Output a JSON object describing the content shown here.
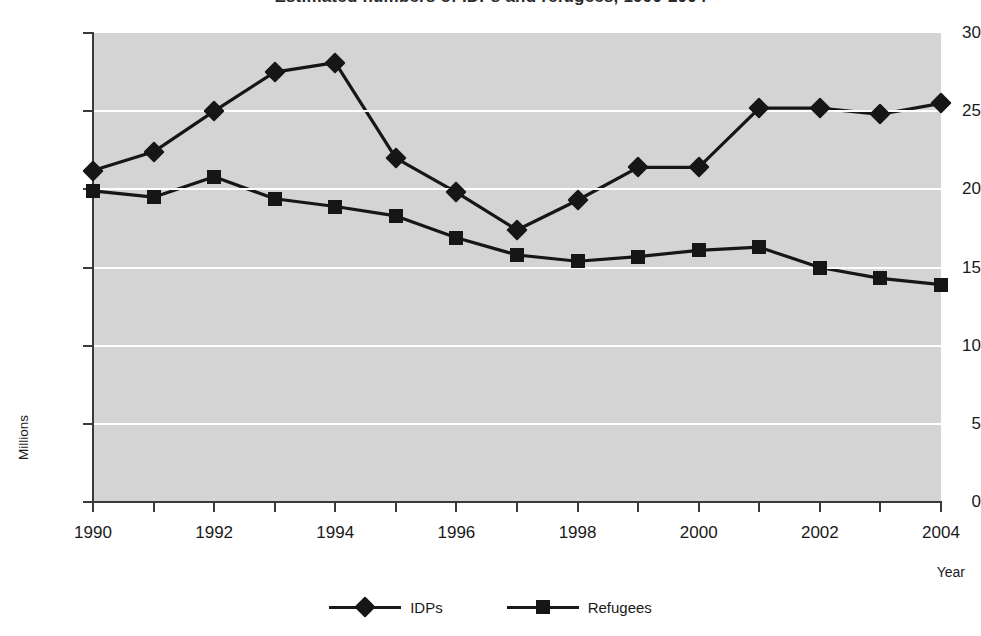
{
  "chart_data": {
    "type": "line",
    "title": "Estimated numbers of IDPs and refugees, 1990-2004",
    "xlabel": "Year",
    "ylabel": "Millions",
    "categories": [
      1990,
      1991,
      1992,
      1993,
      1994,
      1995,
      1996,
      1997,
      1998,
      1999,
      2000,
      2001,
      2002,
      2003,
      2004
    ],
    "xtick_labels": [
      "1990",
      "",
      "1992",
      "",
      "1994",
      "",
      "1996",
      "",
      "1998",
      "",
      "2000",
      "",
      "2002",
      "",
      "2004"
    ],
    "ytick_labels": [
      "0",
      "5",
      "10",
      "15",
      "20",
      "25",
      "30"
    ],
    "ylim": [
      0,
      30
    ],
    "xlim": [
      1990,
      2004
    ],
    "grid": "horizontal",
    "legend_position": "bottom-center",
    "plot_background": "#d4d4d4",
    "gridline_color": "#ffffff",
    "line_color": "#161616",
    "series": [
      {
        "name": "IDPs",
        "marker": "diamond",
        "values": [
          21.2,
          22.4,
          25.0,
          27.5,
          28.1,
          22.0,
          19.8,
          17.4,
          19.3,
          21.4,
          21.4,
          25.2,
          25.2,
          24.8,
          25.5
        ]
      },
      {
        "name": "Refugees",
        "marker": "square",
        "values": [
          19.9,
          19.5,
          20.8,
          19.4,
          18.9,
          18.3,
          16.9,
          15.8,
          15.4,
          15.7,
          16.1,
          16.3,
          15.0,
          14.3,
          13.9
        ]
      }
    ]
  }
}
